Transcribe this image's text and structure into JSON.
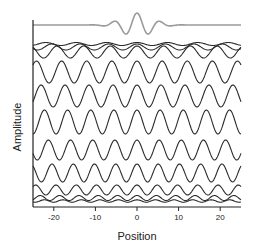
{
  "chart_data": {
    "type": "line",
    "title": "",
    "xlabel": "Position",
    "ylabel": "Amplitude",
    "xlim": [
      -25,
      25
    ],
    "xticks": [
      -20,
      -10,
      0,
      10,
      20
    ],
    "xtick_labels": [
      "-20",
      "-10",
      "0",
      "10",
      "20"
    ],
    "yticks": [],
    "grid": false,
    "legend": null,
    "packet": {
      "name": "Wave packet (sum)",
      "color": "#9a9a9a",
      "center": 0,
      "baseline_px": 25,
      "points": [
        {
          "x": -25,
          "y": 0
        },
        {
          "x": -12,
          "y": 0
        },
        {
          "x": -6,
          "y": 0.45
        },
        {
          "x": -3,
          "y": -0.8
        },
        {
          "x": 0,
          "y": 1.0
        },
        {
          "x": 3,
          "y": -0.8
        },
        {
          "x": 6,
          "y": 0.45
        },
        {
          "x": 12,
          "y": 0
        },
        {
          "x": 25,
          "y": 0
        }
      ]
    },
    "series": [
      {
        "name": "component 1",
        "color": "#2a2a2a",
        "offset_px": 44,
        "amplitude_px": 1.5,
        "wavenumber": 0.86
      },
      {
        "name": "component 2",
        "color": "#2a2a2a",
        "offset_px": 47,
        "amplitude_px": 3,
        "wavenumber": 0.92
      },
      {
        "name": "component 3",
        "color": "#2a2a2a",
        "offset_px": 52,
        "amplitude_px": 6,
        "wavenumber": 0.98
      },
      {
        "name": "component 4",
        "color": "#2a2a2a",
        "offset_px": 72,
        "amplitude_px": 11,
        "wavenumber": 1.04
      },
      {
        "name": "component 5",
        "color": "#2a2a2a",
        "offset_px": 96,
        "amplitude_px": 11,
        "wavenumber": 1.09
      },
      {
        "name": "component 6",
        "color": "#2a2a2a",
        "offset_px": 122,
        "amplitude_px": 12,
        "wavenumber": 1.13
      },
      {
        "name": "component 7",
        "color": "#2a2a2a",
        "offset_px": 150,
        "amplitude_px": 10,
        "wavenumber": 1.18
      },
      {
        "name": "component 8",
        "color": "#2a2a2a",
        "offset_px": 173,
        "amplitude_px": 9,
        "wavenumber": 1.23
      },
      {
        "name": "component 9",
        "color": "#2a2a2a",
        "offset_px": 190,
        "amplitude_px": 5,
        "wavenumber": 1.29
      },
      {
        "name": "component 10",
        "color": "#2a2a2a",
        "offset_px": 198,
        "amplitude_px": 2.5,
        "wavenumber": 1.35
      },
      {
        "name": "component 11",
        "color": "#2a2a2a",
        "offset_px": 201,
        "amplitude_px": 1.2,
        "wavenumber": 1.41
      }
    ]
  },
  "layout": {
    "plot_left": 33,
    "plot_right": 241,
    "plot_top": 20,
    "plot_bottom": 207
  }
}
